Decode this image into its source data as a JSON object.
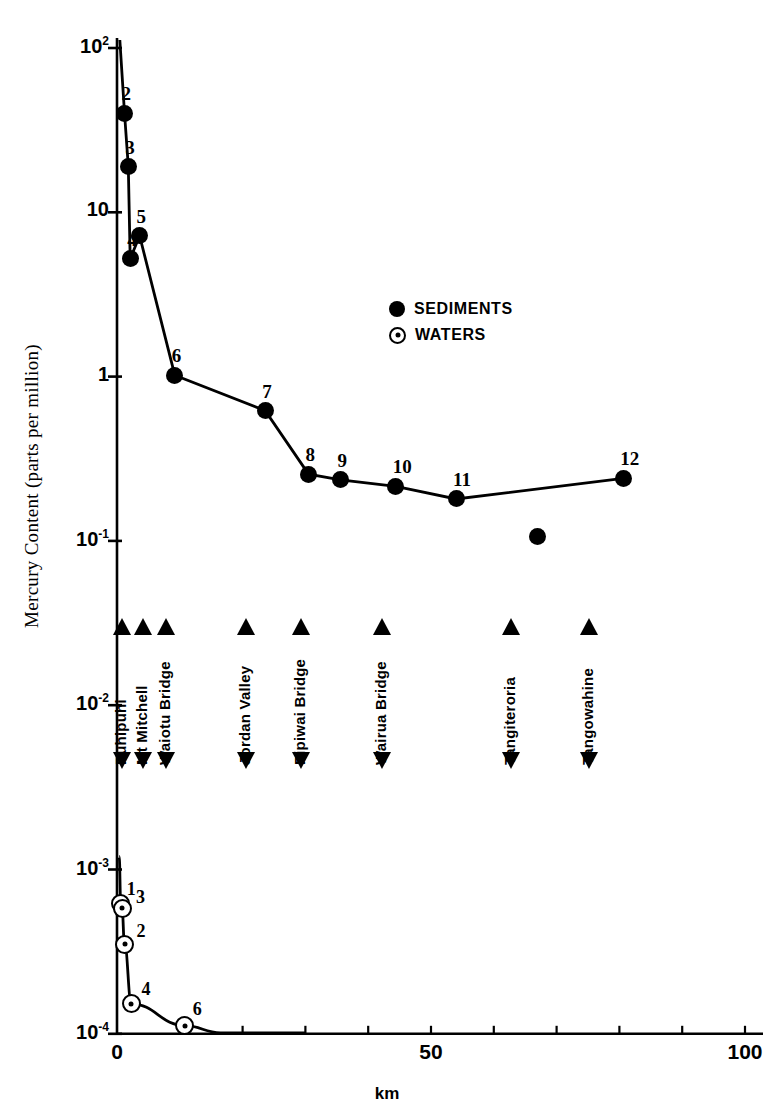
{
  "chart_data": {
    "type": "line",
    "title": "",
    "xlabel": "km",
    "ylabel": "Mercury Content (parts per million)",
    "xlim": [
      0,
      100
    ],
    "ylim": [
      0.0001,
      100
    ],
    "yscale": "log",
    "xscale": "linear",
    "grid": false,
    "x_ticks": [
      0,
      50,
      100
    ],
    "x_tick_labels": [
      "0",
      "50",
      "100"
    ],
    "x_minor_tick_interval": 10,
    "y_ticks": [
      100,
      10,
      1,
      0.1,
      0.01,
      0.001,
      0.0001
    ],
    "y_tick_labels": [
      "10",
      "10",
      "1",
      "10",
      "10",
      "10",
      "10"
    ],
    "y_tick_exponents": [
      "2",
      "",
      "",
      "-1",
      "-2",
      "-3",
      "-4"
    ],
    "legend_position": "upper center",
    "series": [
      {
        "name": "SEDIMENTS",
        "marker": "filled-circle",
        "points": [
          {
            "label": "2",
            "x": 1.2,
            "y": 40.0
          },
          {
            "label": "3",
            "x": 1.8,
            "y": 19.0
          },
          {
            "label": "4",
            "x": 2.1,
            "y": 5.2
          },
          {
            "label": "5",
            "x": 3.6,
            "y": 7.2
          },
          {
            "label": "6",
            "x": 9.2,
            "y": 1.02
          },
          {
            "label": "7",
            "x": 23.6,
            "y": 0.62
          },
          {
            "label": "8",
            "x": 30.5,
            "y": 0.255
          },
          {
            "label": "9",
            "x": 35.6,
            "y": 0.235
          },
          {
            "label": "10",
            "x": 44.4,
            "y": 0.215
          },
          {
            "label": "11",
            "x": 54.0,
            "y": 0.18
          },
          {
            "label": "12",
            "x": 80.6,
            "y": 0.24
          }
        ],
        "unlabeled_points": [
          {
            "x": 66.9,
            "y": 0.107
          }
        ]
      },
      {
        "name": "WATERS",
        "marker": "open-circle",
        "points": [
          {
            "label": "1",
            "x": 0.6,
            "y": 0.00062
          },
          {
            "label": "3",
            "x": 0.8,
            "y": 0.00058
          },
          {
            "label": "2",
            "x": 1.2,
            "y": 0.00035
          },
          {
            "label": "4",
            "x": 2.3,
            "y": 0.000152
          },
          {
            "label": "6",
            "x": 10.8,
            "y": 0.000112
          }
        ]
      }
    ],
    "site_markers": [
      {
        "label": "Puhipuhi",
        "x": 0.8
      },
      {
        "label": "Mt Mitchell",
        "x": 4.2
      },
      {
        "label": "Waiotu Bridge",
        "x": 7.8
      },
      {
        "label": "Jordan Valley",
        "x": 20.6
      },
      {
        "label": "Pipiwai Bridge",
        "x": 29.3
      },
      {
        "label": "Wairua  Bridge",
        "x": 42.2
      },
      {
        "label": "Tangiteroria",
        "x": 62.7
      },
      {
        "label": "Tangowahine",
        "x": 75.2
      }
    ]
  }
}
